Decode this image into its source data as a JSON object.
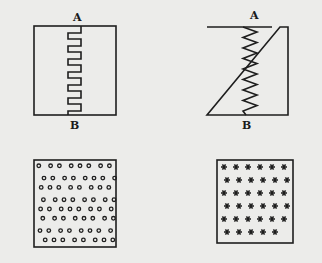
{
  "figures": [
    {
      "id": "square-wave-conductor",
      "top_label": "A",
      "bottom_label": "B"
    },
    {
      "id": "zigzag-conductor",
      "top_label": "A",
      "bottom_label": "B"
    },
    {
      "id": "circle-pattern-panel"
    },
    {
      "id": "star-pattern-panel"
    }
  ],
  "colors": {
    "paper": "#ececea",
    "ink": "#1e1e1e"
  }
}
